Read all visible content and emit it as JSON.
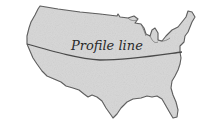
{
  "map": {
    "region": "Contiguous United States",
    "fill_color": "#d6d6d6",
    "outline_color": "#555555",
    "profile_line": {
      "label": "Profile line",
      "color": "#4a4a4a"
    }
  }
}
